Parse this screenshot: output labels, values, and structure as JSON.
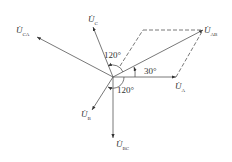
{
  "diagram": {
    "type": "phasor",
    "labels": {
      "ua": {
        "main": "U̇",
        "sub": "A"
      },
      "ub": {
        "main": "U̇",
        "sub": "B"
      },
      "uc": {
        "main": "U̇",
        "sub": "C"
      },
      "uab": {
        "main": "U̇",
        "sub": "AB"
      },
      "ubc": {
        "main": "U̇",
        "sub": "BC"
      },
      "uca": {
        "main": "U̇",
        "sub": "CA"
      }
    },
    "angles": {
      "top": "120°",
      "bottom": "120°",
      "right": "30°"
    },
    "color": "#333333"
  }
}
